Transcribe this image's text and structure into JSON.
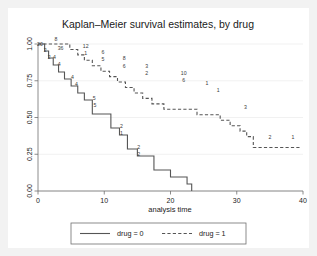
{
  "chart_data": {
    "type": "line",
    "subtype": "kaplan-meier-step",
    "title": "Kaplan–Meier survival estimates, by drug",
    "xlabel": "analysis time",
    "ylabel": "",
    "xlim": [
      0,
      40
    ],
    "ylim": [
      0.0,
      1.0
    ],
    "xticks": [
      0,
      10,
      20,
      30,
      40
    ],
    "xticklabels": [
      "0",
      "10",
      "20",
      "30",
      "40"
    ],
    "yticks": [
      0.0,
      0.25,
      0.5,
      0.75,
      1.0
    ],
    "yticklabels": [
      "0.00",
      "0.25",
      "0.50",
      "0.75",
      "1.00"
    ],
    "grid": true,
    "grid_axis": "y",
    "legend_position": "bottom-center",
    "series": [
      {
        "name": "drug = 0",
        "linestyle": "solid",
        "color": "#555555",
        "points": [
          {
            "t": 0.0,
            "s": 1.0
          },
          {
            "t": 1.0,
            "s": 0.952
          },
          {
            "t": 1.6,
            "s": 0.905
          },
          {
            "t": 2.3,
            "s": 0.857
          },
          {
            "t": 3.1,
            "s": 0.81
          },
          {
            "t": 4.0,
            "s": 0.762
          },
          {
            "t": 5.0,
            "s": 0.714
          },
          {
            "t": 6.0,
            "s": 0.667
          },
          {
            "t": 7.0,
            "s": 0.619
          },
          {
            "t": 8.2,
            "s": 0.524
          },
          {
            "t": 11.0,
            "s": 0.429
          },
          {
            "t": 12.3,
            "s": 0.381
          },
          {
            "t": 13.5,
            "s": 0.286
          },
          {
            "t": 15.0,
            "s": 0.238
          },
          {
            "t": 17.5,
            "s": 0.143
          },
          {
            "t": 20.0,
            "s": 0.095
          },
          {
            "t": 22.5,
            "s": 0.048
          },
          {
            "t": 23.2,
            "s": 0.0
          }
        ],
        "at_risk_labels": [
          {
            "t": 0.3,
            "s": 0.985,
            "text": "20"
          },
          {
            "t": 1.1,
            "s": 0.945,
            "text": "2"
          },
          {
            "t": 1.7,
            "s": 0.9,
            "text": "2"
          },
          {
            "t": 2.5,
            "s": 0.895,
            "text": "4"
          },
          {
            "t": 3.2,
            "s": 0.848,
            "text": "4"
          },
          {
            "t": 5.2,
            "s": 0.76,
            "text": "4"
          },
          {
            "t": 5.8,
            "s": 0.712,
            "text": "4"
          },
          {
            "t": 8.5,
            "s": 0.62,
            "text": "5"
          },
          {
            "t": 8.6,
            "s": 0.572,
            "text": "5"
          },
          {
            "t": 12.6,
            "s": 0.43,
            "text": "2"
          },
          {
            "t": 12.6,
            "s": 0.382,
            "text": "1"
          },
          {
            "t": 15.2,
            "s": 0.288,
            "text": "2"
          },
          {
            "t": 15.2,
            "s": 0.24,
            "text": "2"
          }
        ]
      },
      {
        "name": "drug = 1",
        "linestyle": "dashed",
        "color": "#555555",
        "points": [
          {
            "t": 0.0,
            "s": 1.0
          },
          {
            "t": 4.8,
            "s": 0.963
          },
          {
            "t": 6.0,
            "s": 0.926
          },
          {
            "t": 7.0,
            "s": 0.889
          },
          {
            "t": 8.2,
            "s": 0.852
          },
          {
            "t": 9.5,
            "s": 0.815
          },
          {
            "t": 10.8,
            "s": 0.778
          },
          {
            "t": 12.0,
            "s": 0.741
          },
          {
            "t": 13.2,
            "s": 0.704
          },
          {
            "t": 14.5,
            "s": 0.667
          },
          {
            "t": 15.8,
            "s": 0.63
          },
          {
            "t": 17.2,
            "s": 0.593
          },
          {
            "t": 19.0,
            "s": 0.556
          },
          {
            "t": 24.0,
            "s": 0.519
          },
          {
            "t": 27.5,
            "s": 0.481
          },
          {
            "t": 29.0,
            "s": 0.444
          },
          {
            "t": 30.5,
            "s": 0.407
          },
          {
            "t": 31.5,
            "s": 0.37
          },
          {
            "t": 32.5,
            "s": 0.296
          },
          {
            "t": 39.5,
            "s": 0.296
          }
        ],
        "at_risk_labels": [
          {
            "t": 2.7,
            "s": 1.02,
            "text": "8"
          },
          {
            "t": 3.4,
            "s": 0.958,
            "text": "36"
          },
          {
            "t": 7.2,
            "s": 0.975,
            "text": "12"
          },
          {
            "t": 7.2,
            "s": 0.928,
            "text": "1"
          },
          {
            "t": 9.8,
            "s": 0.93,
            "text": "6"
          },
          {
            "t": 9.8,
            "s": 0.882,
            "text": "5"
          },
          {
            "t": 13.0,
            "s": 0.888,
            "text": "8"
          },
          {
            "t": 13.0,
            "s": 0.84,
            "text": "6"
          },
          {
            "t": 16.4,
            "s": 0.84,
            "text": "3"
          },
          {
            "t": 16.4,
            "s": 0.792,
            "text": "2"
          },
          {
            "t": 22.0,
            "s": 0.79,
            "text": "10"
          },
          {
            "t": 22.0,
            "s": 0.742,
            "text": "6"
          },
          {
            "t": 25.5,
            "s": 0.718,
            "text": "1"
          },
          {
            "t": 27.2,
            "s": 0.672,
            "text": "1"
          },
          {
            "t": 31.3,
            "s": 0.56,
            "text": "3"
          },
          {
            "t": 35.0,
            "s": 0.352,
            "text": "2"
          },
          {
            "t": 38.5,
            "s": 0.352,
            "text": "1"
          }
        ]
      }
    ],
    "legend": [
      {
        "label": "drug = 0",
        "linestyle": "solid"
      },
      {
        "label": "drug = 1",
        "linestyle": "dashed"
      }
    ]
  },
  "colors": {
    "background": "#ffffff",
    "outer_background": "#f2f2f2",
    "line": "#555555",
    "axis": "#6f6f6f",
    "grid": "#ebebeb",
    "text": "#1a1a1a"
  }
}
